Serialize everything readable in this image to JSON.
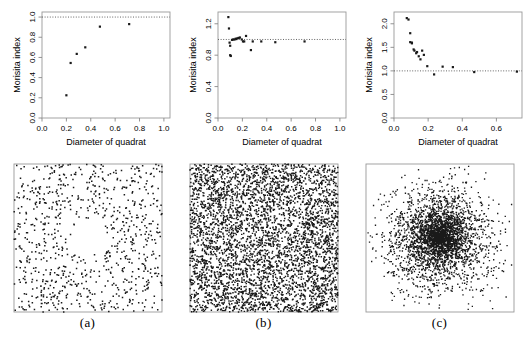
{
  "figure": {
    "panel_labels": [
      "(a)",
      "(b)",
      "(c)"
    ],
    "axis_titles": {
      "x": "Diameter of quadrat",
      "y": "Morisita index"
    },
    "reference_line_value": 1.0,
    "colors": {
      "point": "#1a1a1a",
      "axis": "#888888",
      "frame": "#999999",
      "reference_line": "#555555",
      "background": "#ffffff"
    }
  },
  "chart_data": [
    {
      "type": "scatter",
      "panel": "(a)",
      "title": "",
      "xlabel": "Diameter of quadrat",
      "ylabel": "Morisita index",
      "xlim": [
        0.0,
        1.05
      ],
      "ylim": [
        0.0,
        1.05
      ],
      "xticks": [
        0.0,
        0.2,
        0.4,
        0.6,
        0.8,
        1.0
      ],
      "yticks": [
        0.0,
        0.2,
        0.4,
        0.6,
        0.8,
        1.0
      ],
      "xticklabels": [
        "0.0",
        "0.2",
        "0.4",
        "0.6",
        "0.8",
        "1.0"
      ],
      "yticklabels": [
        "0.0",
        "0.2",
        "0.4",
        "0.6",
        "0.8",
        "1.0"
      ],
      "grid": false,
      "reference_line": {
        "type": "hline",
        "y": 1.0,
        "style": "dotted"
      },
      "x": [
        0.2,
        0.235,
        0.285,
        0.355,
        0.475,
        0.715
      ],
      "y": [
        0.225,
        0.545,
        0.635,
        0.7,
        0.905,
        0.93
      ],
      "pattern": "regular-with-gap"
    },
    {
      "type": "scatter",
      "panel": "(b)",
      "title": "",
      "xlabel": "Diameter of quadrat",
      "ylabel": "Morisita index",
      "xlim": [
        0.0,
        1.05
      ],
      "ylim": [
        0.0,
        1.35
      ],
      "xticks": [
        0.0,
        0.2,
        0.4,
        0.6,
        0.8,
        1.0
      ],
      "yticks": [
        0.0,
        0.4,
        0.8,
        1.2
      ],
      "xticklabels": [
        "0.0",
        "0.2",
        "0.4",
        "0.6",
        "0.8",
        "1.0"
      ],
      "yticklabels": [
        "0.0",
        "0.4",
        "0.8",
        "1.2"
      ],
      "grid": false,
      "reference_line": {
        "type": "hline",
        "y": 1.0,
        "style": "dotted"
      },
      "x": [
        0.085,
        0.09,
        0.095,
        0.1,
        0.1,
        0.105,
        0.115,
        0.125,
        0.135,
        0.145,
        0.15,
        0.16,
        0.17,
        0.18,
        0.195,
        0.205,
        0.215,
        0.23,
        0.27,
        0.285,
        0.355,
        0.47,
        0.71
      ],
      "y": [
        1.285,
        1.14,
        0.96,
        0.92,
        0.8,
        0.79,
        0.995,
        1.0,
        1.0,
        1.01,
        1.005,
        1.015,
        1.02,
        1.025,
        1.0,
        0.975,
        0.975,
        1.045,
        0.865,
        0.975,
        0.975,
        0.965,
        0.975
      ],
      "pattern": "random"
    },
    {
      "type": "scatter",
      "panel": "(c)",
      "title": "",
      "xlabel": "Diameter of quadrat",
      "ylabel": "Morisita index",
      "xlim": [
        0.0,
        0.75
      ],
      "ylim": [
        0.0,
        2.25
      ],
      "xticks": [
        0.0,
        0.2,
        0.4,
        0.6
      ],
      "yticks": [
        0.0,
        0.5,
        1.0,
        1.5,
        2.0
      ],
      "xticklabels": [
        "0.0",
        "0.2",
        "0.4",
        "0.6"
      ],
      "yticklabels": [
        "0.0",
        "0.5",
        "1.0",
        "1.5",
        "2.0"
      ],
      "grid": false,
      "reference_line": {
        "type": "hline",
        "y": 1.0,
        "style": "dotted"
      },
      "x": [
        0.075,
        0.085,
        0.095,
        0.095,
        0.105,
        0.105,
        0.115,
        0.12,
        0.13,
        0.135,
        0.145,
        0.155,
        0.165,
        0.175,
        0.195,
        0.235,
        0.285,
        0.345,
        0.47,
        0.72
      ],
      "y": [
        2.12,
        2.09,
        1.8,
        1.61,
        1.585,
        1.6,
        1.455,
        1.43,
        1.375,
        1.4,
        1.31,
        1.245,
        1.43,
        1.34,
        1.1,
        0.925,
        1.09,
        1.08,
        0.975,
        0.985
      ],
      "pattern": "clustered"
    }
  ]
}
